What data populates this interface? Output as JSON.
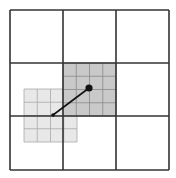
{
  "diagram": {
    "outer_grid": {
      "rows": 3,
      "cols": 3,
      "stroke": "#333333"
    },
    "dark_subgrid": {
      "rows": 4,
      "cols": 4,
      "fill": "#c9c9c9",
      "stroke": "#8a8a8a"
    },
    "light_subgrid": {
      "rows": 4,
      "cols": 4,
      "fill": "#e8e8e8",
      "stroke": "#a8a8a8"
    },
    "connector": {
      "stroke": "#111111",
      "start_point": "small-dot",
      "end_point": "large-dot"
    }
  }
}
